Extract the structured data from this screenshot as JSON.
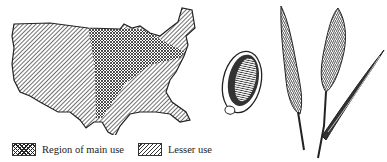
{
  "figure": {
    "type": "illustration",
    "map": {
      "region": "United States (contiguous)",
      "legend": [
        {
          "label": "Region of main use",
          "pattern": "crosshatch"
        },
        {
          "label": "Lesser use",
          "pattern": "diagonal-hatch"
        }
      ]
    },
    "illustrations": [
      {
        "name": "seed",
        "description": "Enlarged seed drawing"
      },
      {
        "name": "seed-head-1",
        "description": "Bristly seed head on stem"
      },
      {
        "name": "seed-head-2",
        "description": "Bristly seed head on stem with leaf blade"
      }
    ],
    "colors": {
      "ink": "#222222",
      "paper": "#ffffff"
    }
  }
}
